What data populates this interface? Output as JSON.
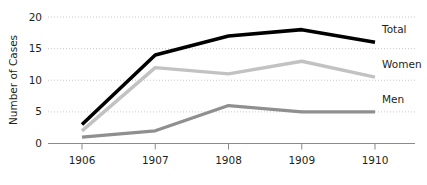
{
  "chart_data": {
    "type": "line",
    "title": "",
    "xlabel": "",
    "ylabel": "Number of Cases",
    "categories": [
      "1906",
      "1907",
      "1908",
      "1909",
      "1910"
    ],
    "x": [
      1906,
      1907,
      1908,
      1909,
      1910
    ],
    "xlim": [
      1906,
      1910
    ],
    "ylim": [
      0,
      20
    ],
    "y_ticks": [
      "0",
      "5",
      "10",
      "15",
      "20"
    ],
    "y_tick_values": [
      0,
      5,
      10,
      15,
      20
    ],
    "grid": "horizontal-dotted",
    "legend_position": "right-inline-labels",
    "series": [
      {
        "name": "Total",
        "label": "Total",
        "color": "#000000",
        "width": 3.6,
        "values": [
          3,
          14,
          17,
          18,
          16
        ]
      },
      {
        "name": "Women",
        "label": "Women",
        "color": "#c2c2c2",
        "width": 3.4,
        "values": [
          2,
          12,
          11,
          13,
          10.5
        ]
      },
      {
        "name": "Men",
        "label": "Men",
        "color": "#8f8f8f",
        "width": 3.2,
        "values": [
          1,
          2,
          6,
          5,
          5
        ]
      }
    ]
  },
  "axes": {
    "y_axis_title": "Number of Cases",
    "axis_color": "#8a8a8a",
    "grid_color": "#c9c9c9",
    "text_color": "#231f20"
  },
  "labels": {
    "series_total": "Total",
    "series_women": "Women",
    "series_men": "Men",
    "y_0": "0",
    "y_5": "5",
    "y_10": "10",
    "y_15": "15",
    "y_20": "20",
    "x_1906": "1906",
    "x_1907": "1907",
    "x_1908": "1908",
    "x_1909": "1909",
    "x_1910": "1910"
  }
}
